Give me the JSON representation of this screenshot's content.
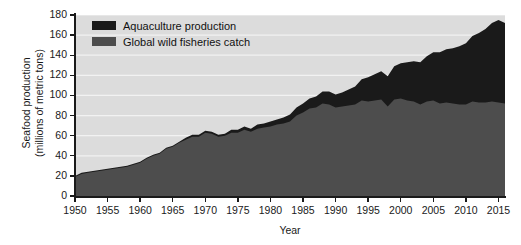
{
  "chart_data": {
    "type": "area",
    "stacked": true,
    "title": "",
    "xlabel": "Year",
    "ylabel": "Seafood production (millions of metric tons)",
    "ylabel_lines": [
      "Seafood production",
      "(millions of metric tons)"
    ],
    "xlim": [
      1950,
      2016
    ],
    "ylim": [
      0,
      180
    ],
    "yticks": [
      0,
      20,
      40,
      60,
      80,
      100,
      120,
      140,
      160,
      180
    ],
    "xticks": [
      1950,
      1955,
      1960,
      1965,
      1970,
      1975,
      1980,
      1985,
      1990,
      1995,
      2000,
      2005,
      2010,
      2015
    ],
    "grid": "horizontal-white",
    "legend_position": "top-left",
    "colors": {
      "aquaculture": "#1a1a1a",
      "wild_catch": "#4d4d4d",
      "plot_background": "#dcdcdc",
      "gridline": "#f2f2f2",
      "axis": "#1a1a1a",
      "figure_background": "#ffffff"
    },
    "x": [
      1950,
      1951,
      1952,
      1953,
      1954,
      1955,
      1956,
      1957,
      1958,
      1959,
      1960,
      1961,
      1962,
      1963,
      1964,
      1965,
      1966,
      1967,
      1968,
      1969,
      1970,
      1971,
      1972,
      1973,
      1974,
      1975,
      1976,
      1977,
      1978,
      1979,
      1980,
      1981,
      1982,
      1983,
      1984,
      1985,
      1986,
      1987,
      1988,
      1989,
      1990,
      1991,
      1992,
      1993,
      1994,
      1995,
      1996,
      1997,
      1998,
      1999,
      2000,
      2001,
      2002,
      2003,
      2004,
      2005,
      2006,
      2007,
      2008,
      2009,
      2010,
      2011,
      2012,
      2013,
      2014,
      2015,
      2016
    ],
    "series": [
      {
        "name": "Global wild fisheries catch",
        "color": "#4d4d4d",
        "values": [
          19,
          22,
          23,
          24,
          25,
          26,
          27,
          28,
          29,
          31,
          33,
          37,
          40,
          42,
          47,
          49,
          53,
          56,
          59,
          59,
          63,
          62,
          59,
          60,
          63,
          63,
          66,
          64,
          67,
          68,
          69,
          71,
          72,
          74,
          80,
          83,
          87,
          88,
          92,
          91,
          88,
          89,
          90,
          91,
          95,
          94,
          95,
          96,
          89,
          96,
          97,
          95,
          94,
          91,
          94,
          95,
          92,
          93,
          92,
          91,
          91,
          94,
          93,
          93,
          94,
          93,
          92
        ]
      },
      {
        "name": "Aquaculture production",
        "color": "#1a1a1a",
        "values": [
          1,
          1,
          1,
          1,
          1,
          1,
          1,
          1,
          1,
          1,
          1,
          1,
          1,
          1,
          1,
          1,
          1,
          2,
          2,
          2,
          2,
          2,
          2,
          2,
          3,
          3,
          3,
          3,
          4,
          4,
          5,
          5,
          6,
          7,
          8,
          9,
          10,
          11,
          12,
          13,
          13,
          14,
          16,
          18,
          21,
          24,
          26,
          28,
          30,
          33,
          35,
          38,
          40,
          42,
          45,
          48,
          51,
          53,
          55,
          58,
          61,
          65,
          69,
          73,
          78,
          82,
          80
        ]
      }
    ],
    "legend": [
      {
        "label": "Aquaculture production",
        "color": "#1a1a1a",
        "swatch": "black-square"
      },
      {
        "label": "Global wild fisheries catch",
        "color": "#4d4d4d",
        "swatch": "gray-square"
      }
    ]
  }
}
